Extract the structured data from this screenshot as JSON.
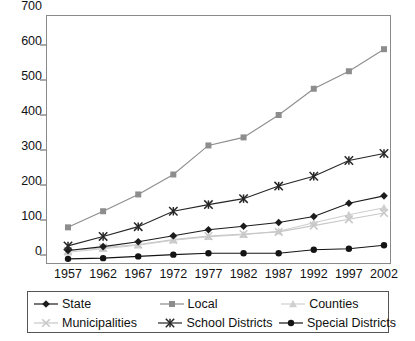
{
  "chart_data": {
    "type": "line",
    "title": "",
    "subtitle": "",
    "xlabel": "",
    "ylabel": "",
    "categories": [
      "1957",
      "1962",
      "1967",
      "1972",
      "1977",
      "1982",
      "1987",
      "1992",
      "1997",
      "2002"
    ],
    "ylim": [
      0,
      700
    ],
    "ytick_labels": [
      "0",
      "100",
      "200",
      "300",
      "400",
      "500",
      "600",
      "700"
    ],
    "ytick_values": [
      0,
      100,
      200,
      300,
      400,
      500,
      600,
      700
    ],
    "grid": false,
    "legend_position": "bottom",
    "series": [
      {
        "name": "State",
        "marker": "diamond",
        "color": "#1c1c1c",
        "values": [
          33,
          44,
          58,
          75,
          92,
          102,
          113,
          130,
          168,
          189
        ]
      },
      {
        "name": "Local",
        "marker": "square",
        "color": "#8d8d8d",
        "values": [
          99,
          145,
          193,
          250,
          333,
          356,
          420,
          495,
          545,
          608
        ]
      },
      {
        "name": "Counties",
        "marker": "triangle",
        "color": "#cfcfcf",
        "values": [
          28,
          38,
          48,
          62,
          72,
          78,
          88,
          112,
          135,
          155
        ]
      },
      {
        "name": "Municipalities",
        "marker": "cross",
        "color": "#c8c8c8",
        "values": [
          32,
          41,
          50,
          64,
          74,
          80,
          86,
          104,
          122,
          140
        ]
      },
      {
        "name": "School Districts",
        "marker": "star",
        "color": "#262626",
        "values": [
          46,
          73,
          101,
          145,
          164,
          181,
          217,
          245,
          290,
          310
        ]
      },
      {
        "name": "Special Districts",
        "marker": "circle",
        "color": "#141414",
        "values": [
          9,
          11,
          16,
          21,
          25,
          25,
          25,
          35,
          38,
          48
        ]
      }
    ]
  },
  "legend": {
    "rows": [
      [
        {
          "label": "State",
          "marker": "diamond",
          "color": "#1c1c1c"
        },
        {
          "label": "Local",
          "marker": "square",
          "color": "#8d8d8d"
        },
        {
          "label": "Counties",
          "marker": "triangle",
          "color": "#cfcfcf"
        }
      ],
      [
        {
          "label": "Municipalities",
          "marker": "cross",
          "color": "#c8c8c8"
        },
        {
          "label": "School Districts",
          "marker": "star",
          "color": "#262626"
        },
        {
          "label": "Special Districts",
          "marker": "circle",
          "color": "#141414"
        }
      ]
    ]
  },
  "axes": {
    "frame_color": "#8a8a8a",
    "tick_color": "#555555",
    "label_color": "#111111"
  }
}
